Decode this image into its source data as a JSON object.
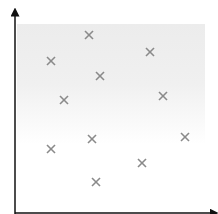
{
  "diagram": {
    "type": "scatter",
    "x_axis": {
      "label": "",
      "arrow": true
    },
    "y_axis": {
      "label": "",
      "arrow": true
    },
    "marker": "x-mark",
    "marker_color": "#8a8a8a",
    "axis_color": "#111111",
    "background": "gray gradient fading to white toward the bottom"
  },
  "chart_data": {
    "type": "scatter",
    "title": "",
    "xlabel": "",
    "ylabel": "",
    "points_px": [
      {
        "x": 89,
        "y": 35
      },
      {
        "x": 51,
        "y": 61
      },
      {
        "x": 150,
        "y": 52
      },
      {
        "x": 100,
        "y": 76
      },
      {
        "x": 64,
        "y": 100
      },
      {
        "x": 163,
        "y": 96
      },
      {
        "x": 185,
        "y": 137
      },
      {
        "x": 92,
        "y": 139
      },
      {
        "x": 51,
        "y": 149
      },
      {
        "x": 142,
        "y": 163
      },
      {
        "x": 96,
        "y": 182
      }
    ],
    "points": [
      {
        "x": 0.39,
        "y": 0.89
      },
      {
        "x": 0.18,
        "y": 0.76
      },
      {
        "x": 0.71,
        "y": 0.8
      },
      {
        "x": 0.45,
        "y": 0.68
      },
      {
        "x": 0.25,
        "y": 0.56
      },
      {
        "x": 0.78,
        "y": 0.58
      },
      {
        "x": 0.9,
        "y": 0.37
      },
      {
        "x": 0.41,
        "y": 0.36
      },
      {
        "x": 0.18,
        "y": 0.31
      },
      {
        "x": 0.65,
        "y": 0.24
      },
      {
        "x": 0.43,
        "y": 0.15
      }
    ],
    "grid": false,
    "legend": null
  }
}
